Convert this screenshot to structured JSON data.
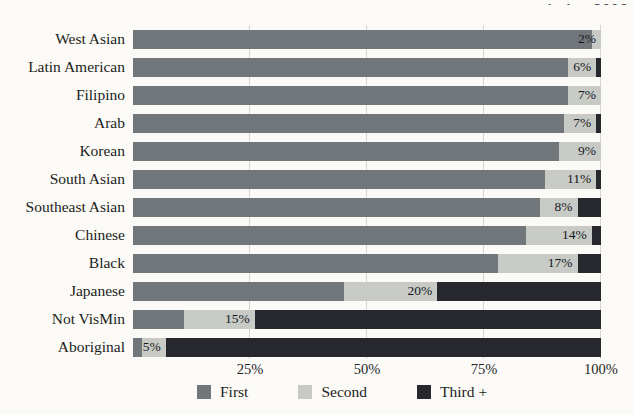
{
  "header": {
    "fragment": "…ission 2006"
  },
  "colors": {
    "paper": "#fbfaf6",
    "first": "#71767b",
    "second": "#c8cbc5",
    "third": "#26282d",
    "gridline": "#d7d6d1",
    "label_text": "#1b1d22"
  },
  "chart_data": {
    "type": "bar",
    "orientation": "horizontal",
    "stacked": true,
    "title": "",
    "xlabel": "",
    "ylabel": "",
    "xlim": [
      0,
      100
    ],
    "grid": "vertical gridlines at 25, 50, 75, 100",
    "legend_position": "bottom",
    "categories": [
      "West Asian",
      "Latin American",
      "Filipino",
      "Arab",
      "Korean",
      "South Asian",
      "Southeast Asian",
      "Chinese",
      "Black",
      "Japanese",
      "Not VisMin",
      "Aboriginal"
    ],
    "series": [
      {
        "name": "First",
        "color": "#71767b",
        "values": [
          98,
          93,
          93,
          92,
          91,
          88,
          87,
          84,
          78,
          45,
          11,
          2
        ]
      },
      {
        "name": "Second",
        "color": "#c8cbc5",
        "values": [
          2,
          6,
          7,
          7,
          9,
          11,
          8,
          14,
          17,
          20,
          15,
          5
        ]
      },
      {
        "name": "Third +",
        "color": "#26282d",
        "values": [
          0,
          1,
          0,
          1,
          0,
          1,
          5,
          2,
          5,
          35,
          74,
          93
        ]
      }
    ],
    "bar_labels": [
      "2%",
      "6%",
      "7%",
      "7%",
      "9%",
      "11%",
      "8%",
      "14%",
      "17%",
      "20%",
      "15%",
      "5%"
    ],
    "bar_label_series": "Second",
    "x_ticks": [
      {
        "label": "25%",
        "value": 25
      },
      {
        "label": "50%",
        "value": 50
      },
      {
        "label": "75%",
        "value": 75
      },
      {
        "label": "100%",
        "value": 100
      }
    ],
    "legend": [
      "First",
      "Second",
      "Third +"
    ]
  }
}
